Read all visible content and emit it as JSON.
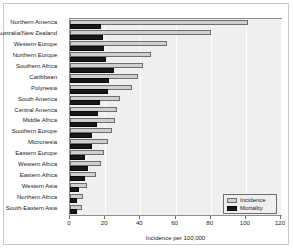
{
  "chart_data": {
    "type": "bar",
    "orientation": "horizontal",
    "title": "",
    "xlabel": "Incidence per 100,000",
    "ylabel": "",
    "xlim": [
      0,
      120
    ],
    "xticks": [
      0,
      20,
      40,
      60,
      80,
      100,
      120
    ],
    "grid": true,
    "legend_position": "bottom-right",
    "categories": [
      "Northern America",
      "Australia/New Zealand",
      "Western Europe",
      "Northern Europe",
      "Southern Africa",
      "Caribbean",
      "Polynesia",
      "South America",
      "Central America",
      "Middle Africa",
      "Southern Europe",
      "Micronesia",
      "Eastern Europe",
      "Western Africa",
      "Eastern Africa",
      "Western Asia",
      "Northern Africa",
      "South-Eastern Asia"
    ],
    "series": [
      {
        "name": "Incidence",
        "color": "#cfcfcf",
        "values": [
          101.1,
          80.0,
          55.0,
          46.0,
          41.5,
          38.5,
          35.0,
          28.5,
          27.0,
          25.5,
          24.0,
          21.5,
          19.5,
          17.5,
          15.0,
          9.5,
          7.5,
          7.0
        ]
      },
      {
        "name": "Mortality",
        "color": "#181818",
        "values": [
          17.5,
          18.5,
          19.5,
          20.5,
          25.0,
          22.0,
          21.5,
          17.0,
          16.0,
          15.5,
          12.5,
          12.5,
          8.5,
          10.5,
          8.5,
          5.0,
          4.0,
          4.0
        ]
      }
    ]
  },
  "legend": {
    "items": [
      {
        "label": "Incidence"
      },
      {
        "label": "Mortality"
      }
    ]
  }
}
